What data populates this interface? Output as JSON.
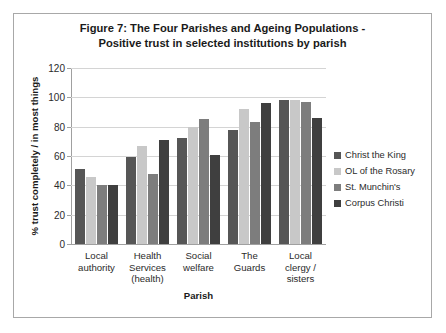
{
  "figure": {
    "title_line1": "Figure 7: The Four Parishes and Ageing Populations -",
    "title_line2": "Positive trust in selected institutions by parish"
  },
  "chart_data": {
    "type": "bar",
    "title": "Figure 7: The Four Parishes and Ageing Populations - Positive trust in selected institutions by parish",
    "xlabel": "Parish",
    "ylabel": "% trust completely / in most things",
    "ylim": [
      0,
      120
    ],
    "ytick_step": 20,
    "yticks": [
      0,
      20,
      40,
      60,
      80,
      100,
      120
    ],
    "ytick_labels": [
      "0",
      "20",
      "40",
      "60",
      "80",
      "100",
      "120"
    ],
    "grid": true,
    "legend_position": "right",
    "categories": [
      "Local authority",
      "Health Services (health)",
      "Social welfare",
      "The Guards",
      "Local clergy / sisters"
    ],
    "category_lines": [
      [
        "Local",
        "authority"
      ],
      [
        "Health",
        "Services",
        "(health)"
      ],
      [
        "Social",
        "welfare"
      ],
      [
        "The",
        "Guards"
      ],
      [
        "Local",
        "clergy /",
        "sisters"
      ]
    ],
    "series": [
      {
        "name": "Christ the King",
        "color": "#565656",
        "values": [
          51,
          59,
          72,
          78,
          98
        ]
      },
      {
        "name": "OL of the Rosary",
        "color": "#c8c8c8",
        "values": [
          46,
          67,
          80,
          92,
          98
        ]
      },
      {
        "name": "St. Munchin's",
        "color": "#7d7d7d",
        "values": [
          40,
          48,
          85,
          83,
          97
        ]
      },
      {
        "name": "Corpus Christi",
        "color": "#3f3f3f",
        "values": [
          40,
          71,
          61,
          96,
          86
        ]
      }
    ]
  }
}
